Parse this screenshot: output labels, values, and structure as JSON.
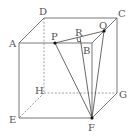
{
  "diagram": {
    "type": "cube",
    "vertices": {
      "A": {
        "label": "A",
        "x": 19,
        "y": 43
      },
      "B": {
        "label": "B",
        "x": 92,
        "y": 43
      },
      "C": {
        "label": "C",
        "x": 117,
        "y": 18
      },
      "D": {
        "label": "D",
        "x": 44,
        "y": 18
      },
      "E": {
        "label": "E",
        "x": 19,
        "y": 118
      },
      "F": {
        "label": "F",
        "x": 92,
        "y": 118
      },
      "G": {
        "label": "G",
        "x": 117,
        "y": 93
      },
      "H": {
        "label": "H",
        "x": 44,
        "y": 93
      }
    },
    "points": {
      "P": {
        "label": "P",
        "x": 55,
        "y": 43
      },
      "Q": {
        "label": "Q",
        "x": 104,
        "y": 31
      },
      "R": {
        "label": "R",
        "x": 80,
        "y": 39
      }
    },
    "visible_edges": [
      "AB",
      "BC",
      "CD",
      "DA",
      "AE",
      "EF",
      "FG",
      "GC",
      "BF"
    ],
    "hidden_edges": [
      "DH",
      "HE",
      "HG"
    ],
    "segments": [
      "PQ",
      "PF",
      "QF",
      "RF",
      "BQ"
    ],
    "right_angle_at": "R"
  }
}
